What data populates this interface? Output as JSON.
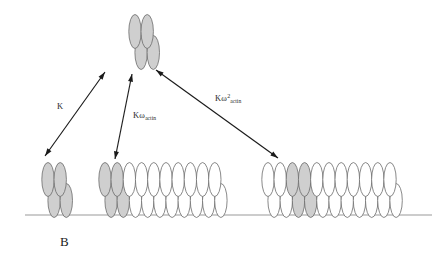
{
  "figure": {
    "panel_letter": "B",
    "width": 445,
    "height": 262,
    "background_color": "#ffffff",
    "baseline": {
      "name": "actin-filament-baseline",
      "x1": 25,
      "x2": 432,
      "y": 215,
      "color": "#999999"
    },
    "subunit_colors": {
      "shaded_fill": "#cfcfcf",
      "open_fill": "#ffffff",
      "outline": "#6b6b6b"
    }
  },
  "species": [
    {
      "id": "free-dimer",
      "name": "free-tropomyosin-dimer",
      "role": "unbound species in solution",
      "position": "top-center",
      "x": 135,
      "y": 42,
      "columns": 2,
      "shaded_count": 4,
      "open_count": 0
    },
    {
      "id": "isolated-bound-dimer",
      "name": "isolated-bound-dimer",
      "role": "single bound unit on bare filament",
      "position": "bottom-left",
      "x": 48,
      "y": 190,
      "columns": 2,
      "shaded_count": 4,
      "open_count": 0
    },
    {
      "id": "end-bound-filament",
      "name": "end-bound-filament",
      "role": "unit bound at filament end, one nearest neighbour contact",
      "position": "bottom-center",
      "x": 105,
      "y": 190,
      "columns": 10,
      "shaded_columns": [
        0,
        1
      ],
      "shaded_count": 4,
      "open_count": 16
    },
    {
      "id": "interior-bound-filament",
      "name": "interior-bound-filament",
      "role": "unit bound in filament interior, two nearest neighbour contacts",
      "position": "bottom-right",
      "x": 268,
      "y": 190,
      "columns": 11,
      "shaded_columns": [
        2,
        3
      ],
      "shaded_count": 4,
      "open_count": 18
    }
  ],
  "equilibria": [
    {
      "id": "K",
      "name": "binding-constant-K",
      "label_text": "K",
      "label_base": "K",
      "label_sup": "",
      "label_sub": "",
      "label_x": 57,
      "label_y": 101,
      "arrow": {
        "x1": 45,
        "y1": 156,
        "x2": 105,
        "y2": 72
      },
      "description": "isolated binding, no neighbour interaction"
    },
    {
      "id": "Kw",
      "name": "binding-constant-K-omega-actin",
      "label_text": "Kω_actin",
      "label_base": "Kω",
      "label_sup": "",
      "label_sub": "actin",
      "label_x": 133,
      "label_y": 110,
      "arrow": {
        "x1": 115,
        "y1": 159,
        "x2": 132,
        "y2": 74
      },
      "description": "binding with one cooperative neighbour contact"
    },
    {
      "id": "Kw2",
      "name": "binding-constant-K-omega-squared-actin",
      "label_text": "Kω2_actin",
      "label_base": "Kω",
      "label_sup": "2",
      "label_sub": "actin",
      "label_x": 215,
      "label_y": 93,
      "arrow": {
        "x1": 278,
        "y1": 158,
        "x2": 156,
        "y2": 70
      },
      "description": "binding with two cooperative neighbour contacts"
    }
  ]
}
